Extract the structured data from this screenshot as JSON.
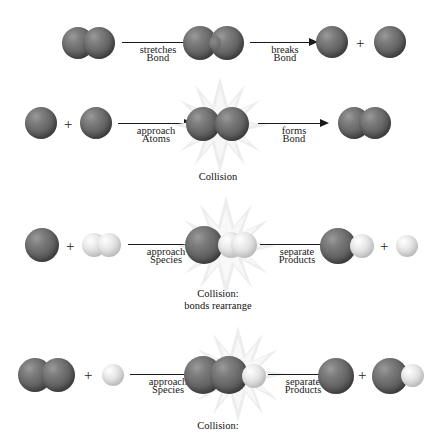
{
  "diagram": {
    "colors": {
      "sphere_dark": "#6a6a6a",
      "sphere_light": "#e2e2e2",
      "burst": "#e8e8e8",
      "text": "#1a1a1a",
      "background": "#ffffff"
    },
    "plus_symbol": "+"
  },
  "rows": [
    {
      "id": "row-1",
      "name": "bond-stretch-and-break",
      "arrows": [
        {
          "top": "Bond",
          "bottom": "stretches"
        },
        {
          "top": "Bond",
          "bottom": "breaks"
        }
      ],
      "caption": ""
    },
    {
      "id": "row-2",
      "name": "atoms-approach-and-bond-forms",
      "arrows": [
        {
          "top": "Atoms",
          "bottom": "approach"
        },
        {
          "top": "Bond",
          "bottom": "forms"
        }
      ],
      "caption": "Collision"
    },
    {
      "id": "row-3",
      "name": "atom-plus-molecule-exchange",
      "arrows": [
        {
          "top": "Species",
          "bottom": "approach"
        },
        {
          "top": "Products",
          "bottom": "separate"
        }
      ],
      "caption_line1": "Collision:",
      "caption_line2": "bonds rearrange"
    },
    {
      "id": "row-4",
      "name": "molecule-plus-atom-exchange",
      "arrows": [
        {
          "top": "Species",
          "bottom": "approach"
        },
        {
          "top": "Products",
          "bottom": "separate"
        }
      ],
      "caption_line1": "Collision:"
    }
  ]
}
